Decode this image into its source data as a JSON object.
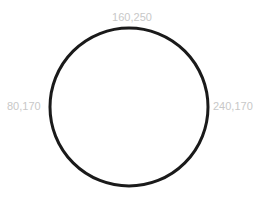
{
  "diagram": {
    "shape": "circle",
    "stroke_color": "#1a1a1a",
    "fill_color": "#ffffff",
    "label_color": "#c8c8c8",
    "labels": {
      "top": "160,250",
      "left": "80,170",
      "right": "240,170"
    }
  }
}
